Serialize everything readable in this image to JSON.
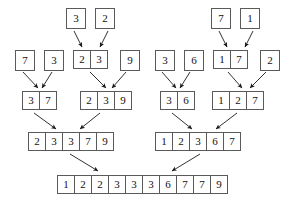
{
  "diagram": {
    "stroke_color": "#5a5a5a",
    "arrow_color": "#1a1a1a",
    "text_color": "#111111",
    "background": "#ffffff",
    "levels": [
      {
        "name": "level-0-singletons-partial",
        "groups": [
          {
            "name": "group-0-a",
            "x": 66,
            "y": 8,
            "values": [
              "3"
            ]
          },
          {
            "name": "group-0-b",
            "x": 95,
            "y": 8,
            "values": [
              "2"
            ]
          },
          {
            "name": "group-0-c",
            "x": 211,
            "y": 8,
            "values": [
              "7"
            ]
          },
          {
            "name": "group-0-d",
            "x": 240,
            "y": 8,
            "values": [
              "1"
            ]
          }
        ]
      },
      {
        "name": "level-1-singletons",
        "groups": [
          {
            "name": "group-1-a",
            "x": 15,
            "y": 50,
            "values": [
              "7"
            ]
          },
          {
            "name": "group-1-b",
            "x": 44,
            "y": 50,
            "values": [
              "3"
            ]
          },
          {
            "name": "group-1-c",
            "x": 73,
            "y": 50,
            "values": [
              "2",
              "3"
            ]
          },
          {
            "name": "group-1-d",
            "x": 120,
            "y": 50,
            "values": [
              "9"
            ]
          },
          {
            "name": "group-1-e",
            "x": 155,
            "y": 50,
            "values": [
              "3"
            ]
          },
          {
            "name": "group-1-f",
            "x": 184,
            "y": 50,
            "values": [
              "6"
            ]
          },
          {
            "name": "group-1-g",
            "x": 213,
            "y": 50,
            "values": [
              "1",
              "7"
            ]
          },
          {
            "name": "group-1-h",
            "x": 260,
            "y": 50,
            "values": [
              "2"
            ]
          }
        ]
      },
      {
        "name": "level-2-pairs",
        "groups": [
          {
            "name": "group-2-a",
            "x": 22,
            "y": 91,
            "values": [
              "3",
              "7"
            ]
          },
          {
            "name": "group-2-b",
            "x": 80,
            "y": 91,
            "values": [
              "2",
              "3",
              "9"
            ]
          },
          {
            "name": "group-2-c",
            "x": 160,
            "y": 91,
            "values": [
              "3",
              "6"
            ]
          },
          {
            "name": "group-2-d",
            "x": 212,
            "y": 91,
            "values": [
              "1",
              "2",
              "7"
            ]
          }
        ]
      },
      {
        "name": "level-3-halves",
        "groups": [
          {
            "name": "group-3-a",
            "x": 28,
            "y": 132,
            "values": [
              "2",
              "3",
              "3",
              "7",
              "9"
            ]
          },
          {
            "name": "group-3-b",
            "x": 155,
            "y": 132,
            "values": [
              "1",
              "2",
              "3",
              "6",
              "7"
            ]
          }
        ]
      },
      {
        "name": "level-4-final",
        "groups": [
          {
            "name": "group-4-final",
            "x": 57,
            "y": 175,
            "values": [
              "1",
              "2",
              "2",
              "3",
              "3",
              "3",
              "6",
              "7",
              "7",
              "9"
            ]
          }
        ]
      }
    ],
    "arrows": [
      {
        "name": "arrow-3-into-cell",
        "x1": 74,
        "y1": 31,
        "x2": 82,
        "y2": 47
      },
      {
        "name": "arrow-2-into-cell",
        "x1": 108,
        "y1": 31,
        "x2": 100,
        "y2": 47
      },
      {
        "name": "arrow-7-into-cell",
        "x1": 219,
        "y1": 31,
        "x2": 227,
        "y2": 47
      },
      {
        "name": "arrow-1-into-cell",
        "x1": 253,
        "y1": 31,
        "x2": 245,
        "y2": 47
      },
      {
        "name": "arrow-merge-7-3",
        "x1": 23,
        "y1": 72,
        "x2": 38,
        "y2": 88
      },
      {
        "name": "arrow-merge-3-7",
        "x1": 52,
        "y1": 72,
        "x2": 42,
        "y2": 88
      },
      {
        "name": "arrow-merge-23-9",
        "x1": 90,
        "y1": 72,
        "x2": 106,
        "y2": 88
      },
      {
        "name": "arrow-merge-9-239",
        "x1": 126,
        "y1": 72,
        "x2": 112,
        "y2": 88
      },
      {
        "name": "arrow-merge-3-6",
        "x1": 162,
        "y1": 72,
        "x2": 176,
        "y2": 88
      },
      {
        "name": "arrow-merge-6-36",
        "x1": 190,
        "y1": 72,
        "x2": 180,
        "y2": 88
      },
      {
        "name": "arrow-merge-17-2",
        "x1": 228,
        "y1": 72,
        "x2": 242,
        "y2": 88
      },
      {
        "name": "arrow-merge-2-127",
        "x1": 266,
        "y1": 72,
        "x2": 250,
        "y2": 88
      },
      {
        "name": "arrow-merge-37-left",
        "x1": 34,
        "y1": 113,
        "x2": 56,
        "y2": 129
      },
      {
        "name": "arrow-merge-239-left",
        "x1": 100,
        "y1": 113,
        "x2": 80,
        "y2": 129
      },
      {
        "name": "arrow-merge-36-right",
        "x1": 172,
        "y1": 113,
        "x2": 192,
        "y2": 129
      },
      {
        "name": "arrow-merge-127-right",
        "x1": 237,
        "y1": 113,
        "x2": 216,
        "y2": 129
      },
      {
        "name": "arrow-final-left",
        "x1": 70,
        "y1": 154,
        "x2": 98,
        "y2": 171
      },
      {
        "name": "arrow-final-right",
        "x1": 200,
        "y1": 154,
        "x2": 172,
        "y2": 171
      }
    ]
  }
}
